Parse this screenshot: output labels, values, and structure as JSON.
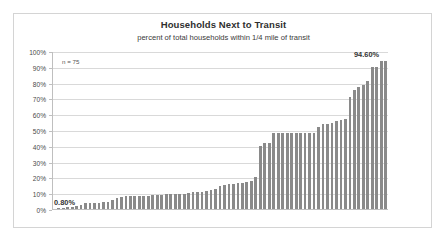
{
  "chart_data": {
    "type": "bar",
    "title": "Households Next to Transit",
    "subtitle": "percent of total households within 1/4 mile of transit",
    "xlabel": "",
    "ylabel": "",
    "ylim": [
      0,
      100
    ],
    "ytick_labels": [
      "100%",
      "90%",
      "80%",
      "70%",
      "60%",
      "50%",
      "40%",
      "30%",
      "20%",
      "10%",
      "0%"
    ],
    "ytick_values": [
      100,
      90,
      80,
      70,
      60,
      50,
      40,
      30,
      20,
      10,
      0
    ],
    "grid": true,
    "legend": "none",
    "sample_size_note": "n = 75",
    "first_value_label": "0.80%",
    "last_value_label": "94.60%",
    "bar_color": "#8a8a8a",
    "gridline_color": "#d9d9d9",
    "categories": [
      "1",
      "2",
      "3",
      "4",
      "5",
      "6",
      "7",
      "8",
      "9",
      "10",
      "11",
      "12",
      "13",
      "14",
      "15",
      "16",
      "17",
      "18",
      "19",
      "20",
      "21",
      "22",
      "23",
      "24",
      "25",
      "26",
      "27",
      "28",
      "29",
      "30",
      "31",
      "32",
      "33",
      "34",
      "35",
      "36",
      "37",
      "38",
      "39",
      "40",
      "41",
      "42",
      "43",
      "44",
      "45",
      "46",
      "47",
      "48",
      "49",
      "50",
      "51",
      "52",
      "53",
      "54",
      "55",
      "56",
      "57",
      "58",
      "59",
      "60",
      "61",
      "62",
      "63",
      "64",
      "65",
      "66",
      "67",
      "68",
      "69",
      "70",
      "71",
      "72",
      "73",
      "74",
      "75"
    ],
    "values": [
      0.8,
      1.0,
      1.3,
      1.7,
      2.2,
      2.6,
      3.0,
      4.6,
      4.6,
      4.6,
      4.7,
      4.8,
      5.0,
      6.4,
      7.4,
      8.2,
      8.6,
      8.7,
      8.8,
      8.9,
      9.0,
      9.1,
      9.2,
      9.4,
      9.6,
      10.0,
      10.0,
      10.0,
      10.1,
      10.3,
      11.0,
      11.2,
      11.4,
      11.7,
      12.2,
      12.4,
      13.0,
      15.2,
      15.8,
      16.2,
      16.5,
      16.8,
      17.2,
      17.6,
      18.3,
      21.2,
      40.8,
      42.4,
      42.5,
      48.7,
      48.8,
      48.8,
      48.8,
      48.8,
      48.8,
      48.9,
      48.9,
      48.9,
      48.9,
      52.6,
      54.2,
      54.4,
      55.0,
      56.4,
      56.8,
      57.4,
      71.6,
      76.1,
      77.6,
      79.4,
      81.5,
      90.8,
      90.8,
      94.6,
      94.6
    ]
  }
}
